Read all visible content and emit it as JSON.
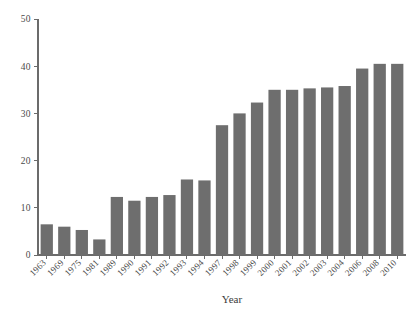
{
  "chart_data": {
    "type": "bar",
    "title": "",
    "subtitle": "",
    "xlabel": "Year",
    "ylabel": "",
    "categories": [
      "1963",
      "1969",
      "1975",
      "1981",
      "1989",
      "1990",
      "1991",
      "1992",
      "1993",
      "1994",
      "1997",
      "1998",
      "1999",
      "2000",
      "2001",
      "2002",
      "2003",
      "2004",
      "2006",
      "2008",
      "2010"
    ],
    "values": [
      6.5,
      6.0,
      5.3,
      3.3,
      12.3,
      11.5,
      12.3,
      12.7,
      16.0,
      15.8,
      27.5,
      30.0,
      32.3,
      35.0,
      35.0,
      35.3,
      35.5,
      35.8,
      39.5,
      40.5,
      40.5
    ],
    "ylim": [
      0,
      50
    ],
    "yticks": [
      0,
      10,
      20,
      30,
      40,
      50
    ],
    "ytick_labels": [
      "0",
      "10",
      "20",
      "30",
      "40",
      "50"
    ],
    "grid": false,
    "legend": false,
    "legend_position": "none",
    "bar_color": "#6e6e6e",
    "axis_color": "#6b6b6b",
    "background_color": "#ffffff",
    "xtick_label_rotation": 45
  },
  "axes": {
    "x_axis_title": "Year",
    "y_axis_title": ""
  }
}
